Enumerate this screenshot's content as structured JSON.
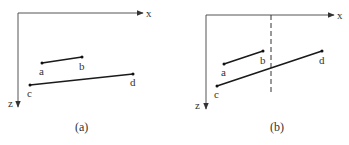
{
  "panels": [
    {
      "id": "a",
      "caption": "(a)",
      "axes": {
        "x_label": "x",
        "z_label": "z"
      },
      "segments": [
        {
          "start_label": "a",
          "end_label": "b"
        },
        {
          "start_label": "c",
          "end_label": "d"
        }
      ],
      "has_dashed_line": false
    },
    {
      "id": "b",
      "caption": "(b)",
      "axes": {
        "x_label": "x",
        "z_label": "z"
      },
      "segments": [
        {
          "start_label": "a",
          "end_label": "b"
        },
        {
          "start_label": "c",
          "end_label": "d"
        }
      ],
      "has_dashed_line": true
    }
  ],
  "colors": {
    "axis": "#555555",
    "segment": "#1a1a1a",
    "dashed_line": "#333333",
    "text": "#333333"
  }
}
